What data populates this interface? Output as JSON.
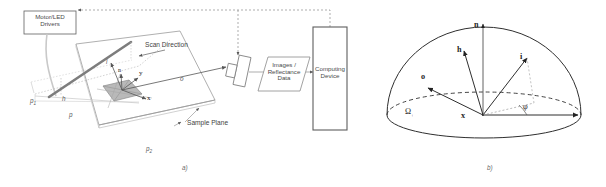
{
  "figure": {
    "panel_a": {
      "caption": "a)",
      "blocks": [
        {
          "id": "motor_led_drivers",
          "line1": "Motor/LED",
          "line2": "Drivers",
          "shape": "rectangle"
        },
        {
          "id": "images_reflectance_data",
          "line1": "Images /",
          "line2": "Reflectance",
          "line3": "Data",
          "shape": "parallelogram"
        },
        {
          "id": "computing_device",
          "line1": "Computing",
          "line2": "Device",
          "shape": "rectangle"
        }
      ],
      "labels": {
        "scan_direction": "Scan Direction",
        "sample_plane": "Sample Plane",
        "axis_x": "x",
        "axis_y": "y",
        "normal": "n",
        "incoming": "i",
        "outgoing": "o",
        "height": "h",
        "pitch": "p",
        "point_1": "p",
        "point_1_sub": "1",
        "point_2": "p",
        "point_2_sub": "2"
      }
    },
    "panel_b": {
      "caption": "b)",
      "labels": {
        "normal": "n",
        "half_vector": "h",
        "incoming": "i",
        "outgoing": "o",
        "surface_point": "x",
        "azimuth_angle": "φ",
        "hemisphere": "Ω",
        "hemisphere_sub": "+"
      }
    }
  },
  "colors": {
    "stroke": "#6e6e6e",
    "stroke_dark": "#2a2a2a",
    "patch_fill": "#b8b8b8",
    "dotted": "#8a8a8a",
    "scanbar": "#8a8a8a",
    "background": "#ffffff"
  }
}
